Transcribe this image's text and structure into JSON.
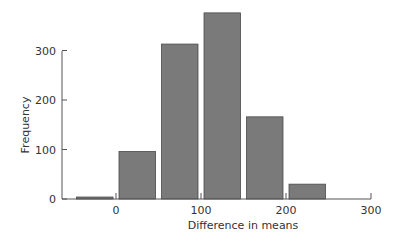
{
  "chart_data": {
    "type": "bar",
    "title": "",
    "xlabel": "Difference in means",
    "ylabel": "Frequency",
    "bins": [
      {
        "start": -50,
        "end": 0,
        "value": 4
      },
      {
        "start": 0,
        "end": 50,
        "value": 96
      },
      {
        "start": 50,
        "end": 100,
        "value": 313
      },
      {
        "start": 100,
        "end": 150,
        "value": 376
      },
      {
        "start": 150,
        "end": 200,
        "value": 166
      },
      {
        "start": 200,
        "end": 250,
        "value": 30
      }
    ],
    "categories": [
      "-50–0",
      "0–50",
      "50–100",
      "100–150",
      "150–200",
      "200–250"
    ],
    "values": [
      4,
      96,
      313,
      376,
      166,
      30
    ],
    "xticks": [
      0,
      100,
      200,
      300
    ],
    "yticks": [
      0,
      100,
      200,
      300
    ],
    "xlim": [
      -60,
      300
    ],
    "ylim": [
      0,
      380
    ],
    "grid": false,
    "legend": null,
    "bar_color": "#7a7a7a",
    "bar_edge_color": "#4a4a4a"
  }
}
